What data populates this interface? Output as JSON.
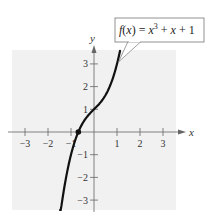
{
  "chart_data": {
    "type": "line",
    "title": "",
    "xlabel": "x",
    "ylabel": "y",
    "xlim": [
      -3.5,
      3.5
    ],
    "ylim": [
      -3.5,
      3.5
    ],
    "grid": false,
    "x_ticks": [
      -3,
      -2,
      -1,
      1,
      2,
      3
    ],
    "y_ticks": [
      -3,
      -2,
      -1,
      1,
      2,
      3
    ],
    "x_tick_labels": [
      "−3",
      "−2",
      "−1",
      "1",
      "2",
      "3"
    ],
    "y_tick_labels": [
      "3",
      "2",
      "1",
      "−1",
      "−2",
      "−3"
    ],
    "series": [
      {
        "name": "f(x) = x^3 + x + 1",
        "function": "x^3 + x + 1",
        "x_range": [
          -1.48,
          1.13
        ],
        "x": [
          -1.48,
          -1.25,
          -1.0,
          -0.75,
          -0.5,
          -0.25,
          0,
          0.25,
          0.5,
          0.75,
          1.0,
          1.13
        ],
        "y": [
          -3.72,
          -2.2,
          -1.0,
          -0.17,
          0.38,
          0.73,
          1.0,
          1.27,
          1.63,
          2.17,
          3.0,
          3.57
        ]
      }
    ],
    "annotations": [
      {
        "type": "callout",
        "text": "f(x) = x³ + x + 1",
        "points_to": [
          1.05,
          3.2
        ]
      },
      {
        "type": "point",
        "label": "x-intercept",
        "x": -0.68,
        "y": 0
      }
    ]
  },
  "labels": {
    "x_axis": "x",
    "y_axis": "y",
    "fn_prefix": "f",
    "fn_paren": "(x) = ",
    "fn_x": "x",
    "fn_exp": "3",
    "fn_rest": " + x + 1"
  },
  "colors": {
    "plot_background": "#f2f2f2",
    "curve": "#111111",
    "axis": "#555555"
  }
}
